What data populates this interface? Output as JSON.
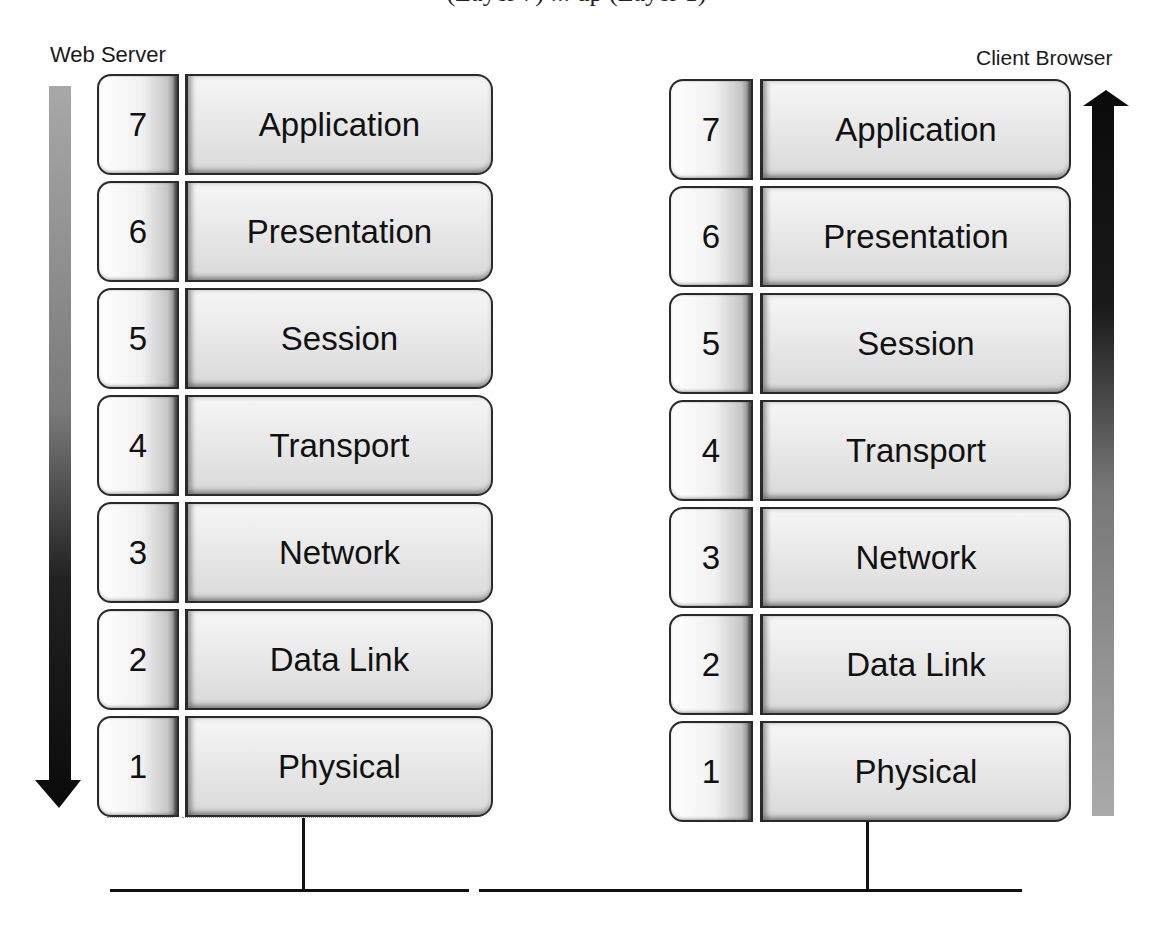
{
  "figure": {
    "clipped_caption_fragment": "(Layer 7) ... up (Layer 1)"
  },
  "left_stack": {
    "title": "Web Server",
    "arrow_direction": "down",
    "layers": [
      {
        "number": "7",
        "name": "Application"
      },
      {
        "number": "6",
        "name": "Presentation"
      },
      {
        "number": "5",
        "name": "Session"
      },
      {
        "number": "4",
        "name": "Transport"
      },
      {
        "number": "3",
        "name": "Network"
      },
      {
        "number": "2",
        "name": "Data Link"
      },
      {
        "number": "1",
        "name": "Physical"
      }
    ]
  },
  "right_stack": {
    "title": "Client Browser",
    "arrow_direction": "up",
    "layers": [
      {
        "number": "7",
        "name": "Application"
      },
      {
        "number": "6",
        "name": "Presentation"
      },
      {
        "number": "5",
        "name": "Session"
      },
      {
        "number": "4",
        "name": "Transport"
      },
      {
        "number": "3",
        "name": "Network"
      },
      {
        "number": "2",
        "name": "Data Link"
      },
      {
        "number": "1",
        "name": "Physical"
      }
    ]
  },
  "colors": {
    "arrow_dark": "#0a0a0a",
    "arrow_light": "#a8a8a8",
    "border": "#2a2a2a",
    "network_line": "#111111"
  }
}
